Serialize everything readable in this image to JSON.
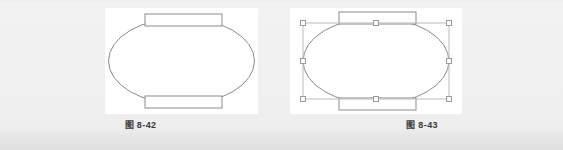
{
  "page": {
    "background_color": "#f1f1f1",
    "bottom_band_color": "#e0e0e0"
  },
  "figures": [
    {
      "id": "figure-8-42",
      "caption": "图 8-42",
      "selected": false,
      "canvas_color": "#ffffff",
      "shape": {
        "kind": "oval-with-top-and-bottom-bars",
        "outline_color": "#8a8a8a",
        "fill_color": "#ffffff",
        "parts": [
          "ellipse",
          "top-rectangle",
          "bottom-rectangle"
        ]
      }
    },
    {
      "id": "figure-8-43",
      "caption": "图 8-43",
      "selected": true,
      "canvas_color": "#ffffff",
      "shape": {
        "kind": "oval-with-top-and-bottom-bars",
        "outline_color": "#8a8a8a",
        "fill_color": "#ffffff",
        "parts": [
          "ellipse",
          "top-rectangle",
          "bottom-rectangle"
        ]
      },
      "selection": {
        "border_color": "#b9b9b9",
        "handle_fill": "#ffffff",
        "handle_stroke": "#9a9a9a",
        "handle_count": 8,
        "handles": [
          "top-left",
          "top-center",
          "top-right",
          "middle-left",
          "middle-right",
          "bottom-left",
          "bottom-center",
          "bottom-right"
        ]
      }
    }
  ]
}
